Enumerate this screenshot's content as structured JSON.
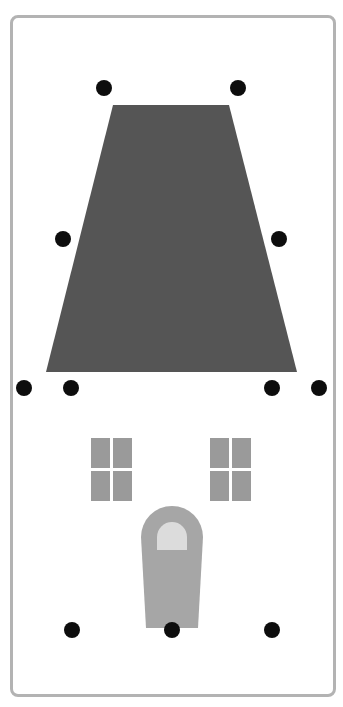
{
  "colors": {
    "frame_border": "#b3b3b3",
    "roof": "#555555",
    "window": "#9a9a9a",
    "door": "#a6a6a6",
    "door_window": "#dcdcdc",
    "dot": "#0d0d0d",
    "background": "#ffffff"
  },
  "roof": {
    "shape": "trapezoid",
    "points": [
      [
        113,
        105
      ],
      [
        229,
        105
      ],
      [
        297,
        372
      ],
      [
        46,
        372
      ]
    ]
  },
  "windows": [
    {
      "name": "left-window",
      "x": 91,
      "y": 438,
      "pane_w": 19,
      "pane_h": 30,
      "gap": 3
    },
    {
      "name": "right-window",
      "x": 210,
      "y": 438,
      "pane_w": 19,
      "pane_h": 30,
      "gap": 3
    }
  ],
  "door": {
    "outline": "M141,537 A31,31 0 0 1 203,537 L198,628 L146,628 Z",
    "window": "M157,537 A15,15 0 0 1 187,537 L187,550 L157,550 Z"
  },
  "dots": [
    {
      "name": "roof-top-left-handle",
      "x": 104,
      "y": 88
    },
    {
      "name": "roof-top-right-handle",
      "x": 238,
      "y": 88
    },
    {
      "name": "roof-mid-left-handle",
      "x": 63,
      "y": 239
    },
    {
      "name": "roof-mid-right-handle",
      "x": 279,
      "y": 239
    },
    {
      "name": "roof-base-outer-left-handle",
      "x": 24,
      "y": 388
    },
    {
      "name": "roof-base-inner-left-handle",
      "x": 71,
      "y": 388
    },
    {
      "name": "roof-base-inner-right-handle",
      "x": 272,
      "y": 388
    },
    {
      "name": "roof-base-outer-right-handle",
      "x": 319,
      "y": 388
    },
    {
      "name": "bottom-left-handle",
      "x": 72,
      "y": 630
    },
    {
      "name": "bottom-center-handle",
      "x": 172,
      "y": 630
    },
    {
      "name": "bottom-right-handle",
      "x": 272,
      "y": 630
    }
  ],
  "dot_radius": 8
}
